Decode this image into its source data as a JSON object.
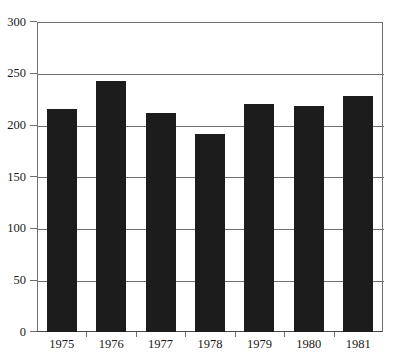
{
  "chart_data": {
    "type": "bar",
    "title": "",
    "subtitle": "",
    "xlabel": "",
    "ylabel": "",
    "categories": [
      "1975",
      "1976",
      "1977",
      "1978",
      "1979",
      "1980",
      "1981"
    ],
    "values": [
      216,
      243,
      212,
      192,
      221,
      219,
      228
    ],
    "series": [
      {
        "name": "",
        "values": [
          216,
          243,
          212,
          192,
          221,
          219,
          228
        ]
      }
    ],
    "ylim": [
      0,
      300
    ],
    "y_ticks": [
      0,
      50,
      100,
      150,
      200,
      250,
      300
    ],
    "y_tick_labels": [
      "0",
      "50",
      "100",
      "150",
      "200",
      "250",
      "300"
    ],
    "grid": true,
    "grid_axis": "y",
    "legend": false,
    "legend_position": "none",
    "bar_color": "#1c1c1c",
    "grid_color": "#6f6f6f",
    "axis_color": "#4a4a4a",
    "background_color": "#ffffff",
    "annotations": []
  }
}
